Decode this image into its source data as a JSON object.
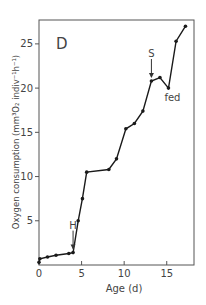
{
  "chart_data": {
    "type": "line",
    "title": "",
    "panel_label": "D",
    "xlabel": "Age (d)",
    "ylabel": "Oxygen consumption (mm³O₂ indiv⁻¹h⁻¹)",
    "xlim": [
      0,
      18.2
    ],
    "ylim": [
      0,
      27.7
    ],
    "xticks": [
      0,
      5,
      10,
      15
    ],
    "yticks": [
      5,
      10,
      15,
      20,
      25
    ],
    "xtick_labels": [
      "0",
      "5",
      "10",
      "15"
    ],
    "ytick_labels": [
      "5",
      "10",
      "15",
      "20",
      "25"
    ],
    "grid": false,
    "legend": null,
    "series": [
      {
        "name": "Oxygen consumption",
        "x": [
          0,
          0.1,
          1,
          2,
          3.5,
          4,
          4.6,
          5.1,
          5.6,
          8.2,
          9.1,
          10.2,
          11.2,
          12.2,
          13.2,
          14.2,
          15.2,
          16.1,
          17.2
        ],
        "y": [
          0.3,
          0.7,
          0.9,
          1.1,
          1.3,
          1.4,
          5.0,
          7.5,
          10.5,
          10.8,
          12.0,
          15.4,
          16.0,
          17.4,
          20.8,
          21.2,
          20.0,
          25.3,
          27.0
        ]
      }
    ],
    "annotations": [
      {
        "text": "H",
        "x": 4.0,
        "y": 1.4,
        "type": "arrow-down"
      },
      {
        "text": "S",
        "x": 13.2,
        "y": 20.8,
        "type": "arrow-down"
      },
      {
        "text": "fed",
        "x": 15.2,
        "y": 20.0,
        "type": "label-below"
      }
    ],
    "colors": {
      "line": "#1a1a1a",
      "axis": "#555555",
      "text": "#444444"
    }
  }
}
